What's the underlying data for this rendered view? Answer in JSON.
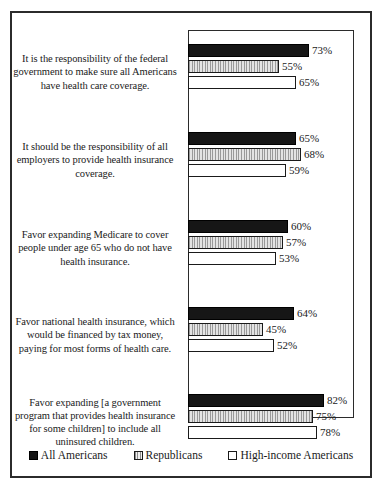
{
  "chart_data": {
    "type": "bar",
    "orientation": "horizontal",
    "title": "",
    "subtitle": "",
    "xlabel": "",
    "ylabel": "",
    "xlim": [
      0,
      100
    ],
    "grid": false,
    "legend_position": "bottom",
    "value_suffix": "%",
    "categories": [
      "It is the responsibility of the federal government to make sure all Americans have health care coverage.",
      "It should be the responsibility of all employers to provide health insurance coverage.",
      "Favor expanding Medicare to cover people under age 65 who do not have health insurance.",
      "Favor national health insurance, which would be financed by tax money, paying for most forms of health care.",
      "Favor expanding [a government program that provides health insurance for some children] to include all uninsured children."
    ],
    "series": [
      {
        "name": "All Americans",
        "key": "all",
        "values": [
          73,
          65,
          60,
          64,
          82
        ],
        "labels": [
          "73%",
          "65%",
          "60%",
          "64%",
          "82%"
        ]
      },
      {
        "name": "Republicans",
        "key": "rep",
        "values": [
          55,
          68,
          57,
          45,
          75
        ],
        "labels": [
          "55%",
          "68%",
          "57%",
          "45%",
          "75%"
        ]
      },
      {
        "name": "High-income Americans",
        "key": "high",
        "values": [
          65,
          59,
          53,
          52,
          78
        ],
        "labels": [
          "65%",
          "59%",
          "53%",
          "52%",
          "78%"
        ]
      }
    ]
  },
  "legend": {
    "items": [
      {
        "label": "All Americans",
        "swatch": "solid-black"
      },
      {
        "label": "Republicans",
        "swatch": "vertical-stripes-gray"
      },
      {
        "label": "High-income Americans",
        "swatch": "white-outline"
      }
    ]
  },
  "colors": {
    "all_americans": "#161616",
    "republicans": "#c9c9c9",
    "high_income": "#ffffff",
    "border": "#1a1a1a",
    "background": "#ffffff"
  }
}
